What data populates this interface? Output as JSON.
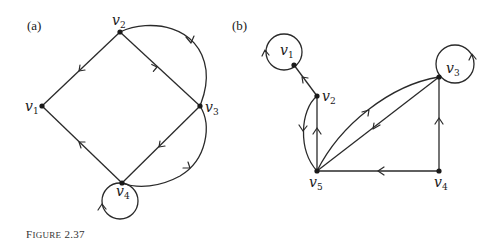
{
  "caption": {
    "first_letter": "F",
    "rest_smallcaps": "IGURE",
    "number": "2.37"
  },
  "panels": [
    {
      "id": "a",
      "label": "(a)",
      "vertices": [
        {
          "name": "v",
          "sub": "1",
          "x": 42,
          "y": 106
        },
        {
          "name": "v",
          "sub": "2",
          "x": 120,
          "y": 32
        },
        {
          "name": "v",
          "sub": "3",
          "x": 200,
          "y": 106
        },
        {
          "name": "v",
          "sub": "4",
          "x": 122,
          "y": 183
        }
      ],
      "edges": [
        {
          "from": "v2",
          "to": "v1",
          "type": "straight"
        },
        {
          "from": "v2",
          "to": "v3",
          "type": "straight"
        },
        {
          "from": "v2",
          "to": "v3",
          "type": "arc"
        },
        {
          "from": "v3",
          "to": "v4",
          "type": "straight"
        },
        {
          "from": "v4",
          "to": "v1",
          "type": "straight"
        },
        {
          "from": "v4",
          "to": "v3",
          "type": "arc"
        },
        {
          "from": "v4",
          "to": "v4",
          "type": "loop"
        }
      ]
    },
    {
      "id": "b",
      "label": "(b)",
      "vertices": [
        {
          "name": "v",
          "sub": "1",
          "x": 294,
          "y": 65
        },
        {
          "name": "v",
          "sub": "2",
          "x": 317,
          "y": 96
        },
        {
          "name": "v",
          "sub": "3",
          "x": 439,
          "y": 77
        },
        {
          "name": "v",
          "sub": "4",
          "x": 439,
          "y": 171
        },
        {
          "name": "v",
          "sub": "5",
          "x": 317,
          "y": 171
        }
      ],
      "edges": [
        {
          "from": "v1",
          "to": "v1",
          "type": "loop"
        },
        {
          "from": "v2",
          "to": "v1",
          "type": "straight"
        },
        {
          "from": "v2",
          "to": "v5",
          "type": "arc"
        },
        {
          "from": "v5",
          "to": "v2",
          "type": "straight"
        },
        {
          "from": "v5",
          "to": "v3",
          "type": "arc"
        },
        {
          "from": "v3",
          "to": "v5",
          "type": "straight"
        },
        {
          "from": "v4",
          "to": "v3",
          "type": "straight"
        },
        {
          "from": "v4",
          "to": "v5",
          "type": "straight"
        },
        {
          "from": "v3",
          "to": "v3",
          "type": "loop"
        }
      ]
    }
  ],
  "colors": {
    "ink": "#1a1a1a",
    "background": "#ffffff"
  }
}
